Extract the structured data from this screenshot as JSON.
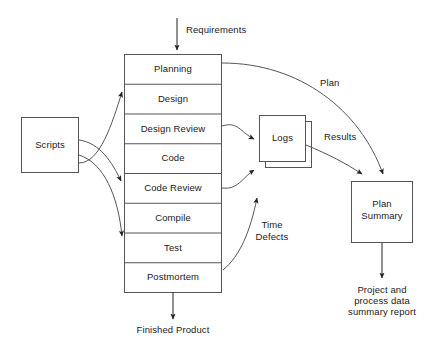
{
  "diagram": {
    "type": "process-flow",
    "stroke_color": "#555555",
    "text_color": "#1a1a1a",
    "background": "#ffffff"
  },
  "inputs": {
    "requirements": "Requirements"
  },
  "outputs": {
    "finished_product": "Finished Product",
    "summary_report": "Project and\nprocess data\nsummary report",
    "summary_report_lines": [
      "Project and",
      "process data",
      "summary report"
    ]
  },
  "scripts_box": {
    "label": "Scripts"
  },
  "process_box": {
    "label": "Process Phases",
    "phases": [
      {
        "label": "Planning"
      },
      {
        "label": "Design"
      },
      {
        "label": "Design Review"
      },
      {
        "label": "Code"
      },
      {
        "label": "Code Review"
      },
      {
        "label": "Compile"
      },
      {
        "label": "Test"
      },
      {
        "label": "Postmortem"
      }
    ]
  },
  "logs_box": {
    "label": "Logs",
    "style": "stacked"
  },
  "plan_summary_box": {
    "label_line1": "Plan",
    "label_line2": "Summary"
  },
  "flow_labels": {
    "plan": "Plan",
    "results": "Results",
    "time_defects_line1": "Time",
    "time_defects_line2": "Defects"
  }
}
